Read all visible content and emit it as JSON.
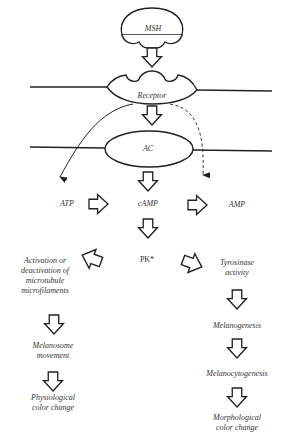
{
  "diagram": {
    "nodes": {
      "msh": "MSH",
      "receptor": "Receptor",
      "ac": "AC",
      "atp": "ATP",
      "camp": "cAMP",
      "amp": "AMP",
      "pk": "PK*",
      "left_branch": {
        "activation_line1": "Activation or",
        "activation_line2": "deactivation of",
        "activation_line3": "microtubule",
        "activation_line4": "microfilaments",
        "melanosome_line1": "Melanosome",
        "melanosome_line2": "movement",
        "physio_line1": "Physiological",
        "physio_line2": "color change"
      },
      "right_branch": {
        "tyrosinase_line1": "Tyrosinase",
        "tyrosinase_line2": "activity",
        "melanogenesis": "Melanogenesis",
        "melanocytogenesis": "Melanocytogenesis",
        "morpho_line1": "Morphological",
        "morpho_line2": "color change"
      }
    },
    "edges": [
      {
        "from": "MSH",
        "to": "Receptor",
        "style": "hollow-arrow"
      },
      {
        "from": "Receptor",
        "to": "AC",
        "style": "hollow-arrow"
      },
      {
        "from": "Receptor",
        "to": "ATP",
        "style": "solid-curve"
      },
      {
        "from": "Receptor",
        "to": "AMP",
        "style": "dashed-curve"
      },
      {
        "from": "AC",
        "to": "cAMP",
        "style": "hollow-arrow"
      },
      {
        "from": "ATP",
        "to": "cAMP",
        "style": "hollow-arrow"
      },
      {
        "from": "cAMP",
        "to": "AMP",
        "style": "hollow-arrow"
      },
      {
        "from": "cAMP",
        "to": "PK*",
        "style": "hollow-arrow"
      },
      {
        "from": "PK*",
        "to": "Activation or deactivation of microtubule microfilaments",
        "style": "hollow-arrow"
      },
      {
        "from": "PK*",
        "to": "Tyrosinase activity",
        "style": "hollow-arrow"
      },
      {
        "from": "Activation",
        "to": "Melanosome movement",
        "style": "hollow-arrow"
      },
      {
        "from": "Melanosome movement",
        "to": "Physiological color change",
        "style": "hollow-arrow"
      },
      {
        "from": "Tyrosinase activity",
        "to": "Melanogenesis",
        "style": "hollow-arrow"
      },
      {
        "from": "Melanogenesis",
        "to": "Melanocytogenesis",
        "style": "hollow-arrow"
      },
      {
        "from": "Melanocytogenesis",
        "to": "Morphological color change",
        "style": "hollow-arrow"
      }
    ]
  }
}
